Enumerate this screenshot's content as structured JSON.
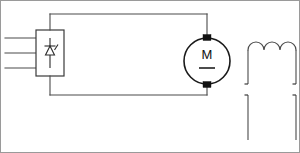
{
  "diagram": {
    "canvas": {
      "width": 300,
      "height": 153,
      "background": "#ffffff"
    },
    "line_color": "#4a4a4a",
    "accent_color": "#111111",
    "components": {
      "rectifier": {
        "name": "rectifier-block",
        "symbol": "thyristor-converter",
        "x": 36,
        "y": 30,
        "width": 28,
        "height": 46,
        "inputs": 3,
        "input_labels": [
          "L1",
          "L2",
          "L3"
        ]
      },
      "motor": {
        "name": "dc-motor",
        "symbol": "motor-circle",
        "label": "M",
        "sublabel": "dc-bar",
        "cx": 207,
        "cy": 61,
        "r": 23
      },
      "coil": {
        "name": "field-winding",
        "symbol": "inductor-coil",
        "humps": 3,
        "x": 244,
        "y": 38,
        "width": 52,
        "height": 102
      }
    },
    "wires": {
      "top_rail_y": 14,
      "bottom_rail_y": 95,
      "left_x": 50,
      "right_x": 207
    }
  }
}
